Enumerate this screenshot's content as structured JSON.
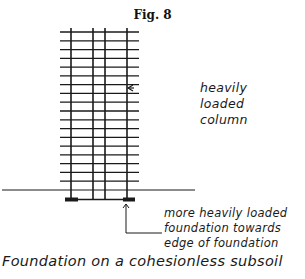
{
  "figure": {
    "title": "Fig. 8",
    "caption": "Foundation on a cohesionless subsoil"
  },
  "annotations": {
    "column_label": [
      "heavily",
      "loaded",
      "column"
    ],
    "foundation_label": [
      "more heavily loaded",
      "foundation towards",
      "edge of foundation"
    ]
  },
  "drawing": {
    "stroke_color": "#1a1a1a",
    "building": {
      "floors": 19,
      "grid_left": 60,
      "grid_right": 139,
      "top_y": 32,
      "ground_y": 190,
      "columns_x": [
        71,
        93,
        105,
        127
      ]
    },
    "ground_line": {
      "x1": 2,
      "x2": 195,
      "y": 190
    },
    "footings": [
      {
        "name": "left-footing",
        "x1": 65,
        "x2": 78
      },
      {
        "name": "right-footing",
        "x1": 123,
        "x2": 135
      }
    ]
  }
}
